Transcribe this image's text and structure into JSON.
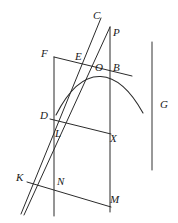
{
  "figure": {
    "background_color": "#ffffff",
    "stroke_color": "#2b2b2b",
    "width": 178,
    "height": 223,
    "labels": [
      {
        "id": "C",
        "text": "C",
        "x": 93,
        "y": 10
      },
      {
        "id": "P",
        "text": "P",
        "x": 113,
        "y": 27
      },
      {
        "id": "F",
        "text": "F",
        "x": 41,
        "y": 48
      },
      {
        "id": "E",
        "text": "E",
        "x": 75,
        "y": 51
      },
      {
        "id": "O",
        "text": "O",
        "x": 95,
        "y": 62
      },
      {
        "id": "B",
        "text": "B",
        "x": 113,
        "y": 62
      },
      {
        "id": "G",
        "text": "G",
        "x": 160,
        "y": 99
      },
      {
        "id": "D",
        "text": "D",
        "x": 40,
        "y": 110
      },
      {
        "id": "L",
        "text": "L",
        "x": 55,
        "y": 128
      },
      {
        "id": "X",
        "text": "X",
        "x": 110,
        "y": 133
      },
      {
        "id": "K",
        "text": "K",
        "x": 16,
        "y": 172
      },
      {
        "id": "N",
        "text": "N",
        "x": 57,
        "y": 176
      },
      {
        "id": "M",
        "text": "M",
        "x": 110,
        "y": 194
      }
    ],
    "segments": [
      {
        "id": "left-vertical-F-bottom",
        "from": [
          54,
          57
        ],
        "to": [
          54,
          216
        ]
      },
      {
        "id": "right-vertical-P-bottom",
        "from": [
          110,
          27
        ],
        "to": [
          110,
          212
        ]
      },
      {
        "id": "top-transversal-F-B",
        "from": [
          54,
          57
        ],
        "to": [
          132,
          76
        ]
      },
      {
        "id": "mid-transversal-D-X",
        "from": [
          50,
          119
        ],
        "to": [
          110,
          134
        ]
      },
      {
        "id": "low-transversal-K-M",
        "from": [
          27,
          182
        ],
        "to": [
          111,
          207
        ]
      },
      {
        "id": "chord-K-C",
        "from": [
          21,
          214
        ],
        "to": [
          101,
          18
        ]
      },
      {
        "id": "chord-K-P",
        "from": [
          24,
          215
        ],
        "to": [
          110,
          27
        ]
      }
    ],
    "curves": [
      {
        "id": "parabolic-arc",
        "start": [
          56,
          115
        ],
        "control1": [
          84,
          60
        ],
        "control2": [
          118,
          68
        ],
        "end": [
          143,
          113
        ]
      }
    ],
    "axes": [
      {
        "id": "right-vertical-axis-G",
        "from": [
          152,
          42
        ],
        "to": [
          152,
          170
        ]
      }
    ]
  }
}
